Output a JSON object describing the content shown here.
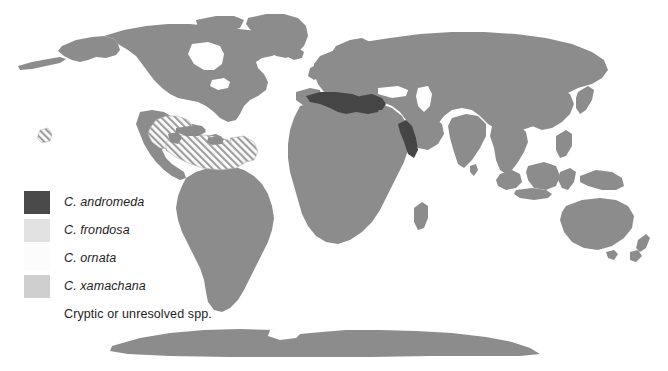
{
  "figure": {
    "kind": "world-distribution-map",
    "projection": "equirectangular",
    "background_color": "#ffffff",
    "land_color": "#8c8c8c",
    "ocean_color": "#ffffff"
  },
  "legend": {
    "items": [
      {
        "label": "C. andromeda",
        "style": "italic",
        "swatch_type": "solid",
        "color": "#4a4a4a",
        "swatch_name": "legend-swatch-c-andromeda"
      },
      {
        "label": "C. frondosa",
        "style": "italic",
        "swatch_type": "solid",
        "color": "#e2e2e2",
        "swatch_name": "legend-swatch-c-frondosa"
      },
      {
        "label": "C. ornata",
        "style": "italic",
        "swatch_type": "solid",
        "color": "#fcfcfc",
        "swatch_name": "legend-swatch-c-ornata"
      },
      {
        "label": "C. xamachana",
        "style": "italic",
        "swatch_type": "solid",
        "color": "#cfcfcf",
        "swatch_name": "legend-swatch-c-xamachana"
      },
      {
        "label": "Cryptic or unresolved spp.",
        "style": "normal",
        "swatch_type": "none",
        "color": "",
        "swatch_name": "legend-swatch-cryptic"
      }
    ]
  },
  "map_features": {
    "andromeda_regions": [
      "Mediterranean Sea",
      "Red Sea"
    ],
    "hatched_regions": [
      "Gulf of Mexico",
      "Caribbean Sea",
      "Lesser Antilles",
      "Eastern Pacific marker"
    ],
    "hatch_color": "#9a9a9a",
    "andromeda_color": "#4a4a4a"
  }
}
